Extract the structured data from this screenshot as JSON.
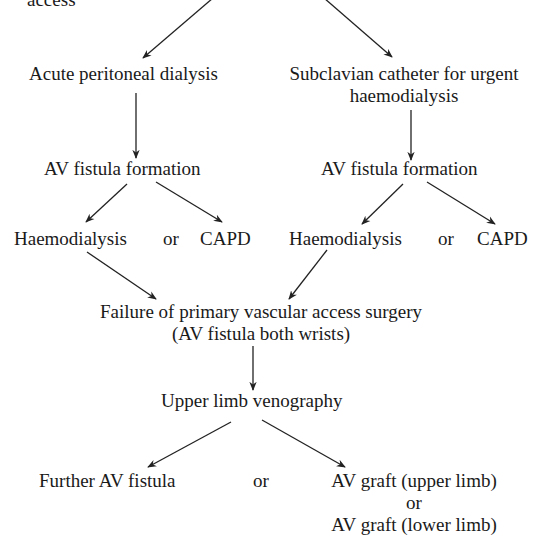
{
  "diagram": {
    "type": "flowchart",
    "nodes": {
      "top_fragment": "access",
      "acute_pd": "Acute peritoneal dialysis",
      "subclavian": {
        "line1": "Subclavian catheter for urgent",
        "line2": "haemodialysis"
      },
      "avf_left": "AV fistula formation",
      "avf_right": "AV fistula formation",
      "left_options": {
        "a": "Haemodialysis",
        "or": "or",
        "b": "CAPD"
      },
      "right_options": {
        "a": "Haemodialysis",
        "or": "or",
        "b": "CAPD"
      },
      "failure": {
        "line1": "Failure of primary vascular access surgery",
        "line2": "(AV fistula both wrists)"
      },
      "venography": "Upper limb venography",
      "further_avf": "Further AV fistula",
      "final_or": "or",
      "grafts": {
        "line1": "AV graft (upper limb)",
        "line2": "or",
        "line3": "AV graft (lower limb)"
      }
    },
    "edges": [
      {
        "from": "top",
        "to": "acute_pd"
      },
      {
        "from": "top",
        "to": "subclavian"
      },
      {
        "from": "acute_pd",
        "to": "avf_left"
      },
      {
        "from": "subclavian",
        "to": "avf_right"
      },
      {
        "from": "avf_left",
        "to": "left_options.a"
      },
      {
        "from": "avf_left",
        "to": "left_options.b"
      },
      {
        "from": "avf_right",
        "to": "right_options.a"
      },
      {
        "from": "avf_right",
        "to": "right_options.b"
      },
      {
        "from": "left_options.a",
        "to": "failure"
      },
      {
        "from": "right_options.a",
        "to": "failure"
      },
      {
        "from": "failure",
        "to": "venography"
      },
      {
        "from": "venography",
        "to": "further_avf"
      },
      {
        "from": "venography",
        "to": "grafts"
      }
    ]
  }
}
